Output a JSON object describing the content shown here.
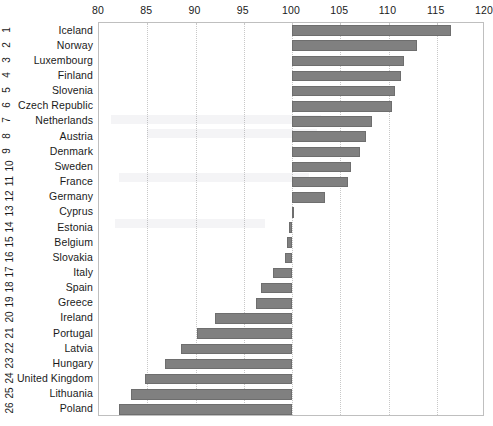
{
  "chart_data": {
    "type": "bar",
    "orientation": "horizontal",
    "title": "",
    "subtitle": "",
    "xlabel": "",
    "ylabel": "",
    "xlim": [
      80,
      120
    ],
    "ylim": [
      0,
      27
    ],
    "grid": true,
    "grid_axis": "x",
    "legend": null,
    "baseline": 100,
    "axis_position": "top",
    "xticks": [
      80,
      85,
      90,
      95,
      100,
      105,
      110,
      115,
      120
    ],
    "xtick_labels": [
      "80",
      "85",
      "90",
      "95",
      "100",
      "105",
      "110",
      "115",
      "120"
    ],
    "categories": [
      "Iceland",
      "Norway",
      "Luxembourg",
      "Finland",
      "Slovenia",
      "Czech Republic",
      "Netherlands",
      "Austria",
      "Denmark",
      "Sweden",
      "France",
      "Germany",
      "Cyprus",
      "Estonia",
      "Belgium",
      "Slovakia",
      "Italy",
      "Spain",
      "Greece",
      "Ireland",
      "Portugal",
      "Latvia",
      "Hungary",
      "United Kingdom",
      "Lithuania",
      "Poland"
    ],
    "category_indices": [
      "1",
      "2",
      "3",
      "4",
      "5",
      "6",
      "7",
      "8",
      "9",
      "10",
      "11",
      "12",
      "13",
      "14",
      "15",
      "16",
      "17",
      "18",
      "19",
      "20",
      "21",
      "22",
      "23",
      "24",
      "25",
      "26"
    ],
    "values": [
      116.5,
      113.0,
      111.6,
      111.3,
      110.7,
      110.4,
      108.3,
      107.7,
      107.0,
      106.1,
      105.8,
      103.4,
      100.2,
      99.7,
      99.5,
      99.3,
      98.0,
      96.8,
      96.3,
      92.0,
      90.2,
      88.5,
      86.8,
      84.8,
      83.3,
      82.1
    ],
    "bar_color": "#808080",
    "bar_edge_color": "#6e6e6e",
    "grid_color": "#c8c8c8",
    "panel_border_color": "#bfbfbf",
    "background_color": "#ffffff",
    "text_color": "#1a1a1a"
  }
}
